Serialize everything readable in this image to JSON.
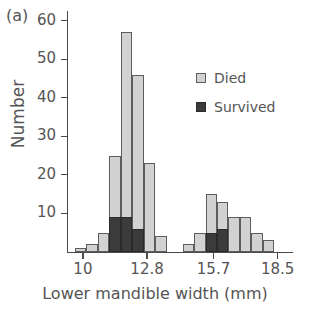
{
  "chart_data": {
    "type": "bar",
    "subtype": "stacked-histogram",
    "panel_label": "(a)",
    "title": "",
    "xlabel": "Lower mandible width (mm)",
    "ylabel": "Number",
    "xlim": [
      9.35,
      19.15
    ],
    "ylim": [
      0,
      62
    ],
    "grid": false,
    "legend_position": "inside-upper-right",
    "xticks": [
      10,
      12.8,
      15.7,
      18.5
    ],
    "xtick_labels": [
      "10",
      "12.8",
      "15.7",
      "18.5"
    ],
    "yticks": [
      10,
      20,
      30,
      40,
      50,
      60
    ],
    "ytick_labels": [
      "10",
      "20",
      "30",
      "40",
      "50",
      "60"
    ],
    "bin_width": 0.5,
    "series": [
      {
        "name": "Died",
        "color": "#d2d2d2",
        "values": [
          1,
          2,
          5,
          16,
          48,
          40,
          23,
          4,
          0,
          0,
          2,
          5,
          10,
          7,
          9,
          9,
          5,
          3
        ]
      },
      {
        "name": "Survived",
        "color": "#3b3b3b",
        "values": [
          0,
          0,
          0,
          9,
          9,
          6,
          0,
          0,
          0,
          0,
          0,
          0,
          5,
          6,
          0,
          0,
          0,
          0
        ]
      }
    ],
    "bin_centers": [
      9.9,
      10.4,
      10.9,
      11.4,
      11.9,
      12.4,
      12.9,
      13.4,
      13.9,
      14.4,
      14.6,
      15.1,
      15.6,
      16.1,
      16.6,
      17.1,
      17.6,
      18.1
    ],
    "bin_totals": [
      1,
      2,
      5,
      25,
      57,
      46,
      23,
      4,
      0,
      0,
      2,
      5,
      15,
      13,
      9,
      9,
      5,
      3
    ]
  },
  "legend": {
    "items": [
      {
        "label": "Died",
        "color": "#d2d2d2"
      },
      {
        "label": "Survived",
        "color": "#3b3b3b"
      }
    ]
  }
}
